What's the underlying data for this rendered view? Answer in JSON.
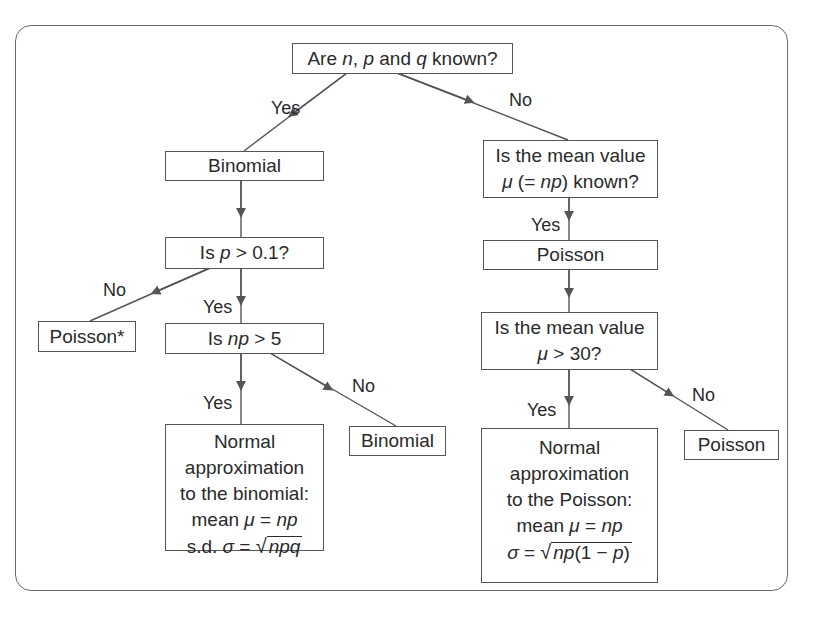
{
  "diagram": {
    "type": "flowchart",
    "nodes": {
      "root": {
        "pre": "Are ",
        "n": "n",
        "c1": ", ",
        "p": "p",
        "mid": " and ",
        "q": "q",
        "post": " known?"
      },
      "binomial_top": {
        "text": "Binomial"
      },
      "mean_known": {
        "line1": "Is the mean value",
        "mu": "μ",
        "paren_open": " (= ",
        "np": "np",
        "paren_close": ") known?"
      },
      "p_check": {
        "pre": "Is ",
        "p": "p",
        "post": " > 0.1?"
      },
      "poisson_mid": {
        "text": "Poisson"
      },
      "poisson_star": {
        "text": "Poisson*"
      },
      "np_check": {
        "pre": "Is ",
        "np": "np",
        "post": " > 5"
      },
      "mean_gt30": {
        "line1": "Is the mean value",
        "mu": "μ",
        "post": " > 30?"
      },
      "binomial_bottom": {
        "text": "Binomial"
      },
      "normal_binomial": {
        "line1": "Normal",
        "line2": "approximation",
        "line3": "to the binomial:",
        "mean_pre": "mean ",
        "mu": "μ",
        "eq": " = ",
        "np": "np",
        "sd_pre": "s.d. ",
        "sigma": "σ",
        "eq2": " = ",
        "radical": "√",
        "radicand": "npq"
      },
      "poisson_bottom": {
        "text": "Poisson"
      },
      "normal_poisson": {
        "line1": "Normal",
        "line2": "approximation",
        "line3": "to the Poisson:",
        "mean_pre": "mean ",
        "mu": "μ",
        "eq": " = ",
        "np": "np",
        "sigma": "σ",
        "eq2": " = ",
        "radical": "√",
        "radicand_np": "np",
        "radicand_rest": "(1 − ",
        "radicand_p": "p",
        "radicand_close": ")"
      }
    },
    "edge_labels": {
      "root_yes": "Yes",
      "root_no": "No",
      "mean_known_yes": "Yes",
      "p_check_no": "No",
      "p_check_yes": "Yes",
      "np_check_yes": "Yes",
      "np_check_no": "No",
      "mean_gt30_yes": "Yes",
      "mean_gt30_no": "No"
    },
    "colors": {
      "line": "#555555",
      "text": "#2a2a2a",
      "frame": "#6a6a6a",
      "background": "#ffffff"
    }
  }
}
